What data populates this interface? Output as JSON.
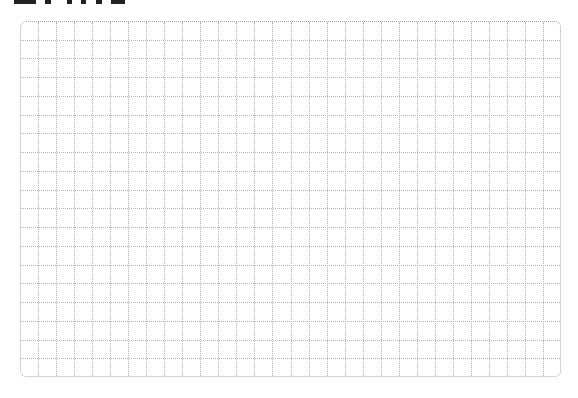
{
  "page": {
    "title_visible": false,
    "footer_visible": false
  },
  "grid": {
    "columns": 30,
    "rows": 19,
    "line_style": "dotted",
    "line_color": "#b4b4b4",
    "border_color": "#a8a8a8",
    "background": "#ffffff"
  }
}
